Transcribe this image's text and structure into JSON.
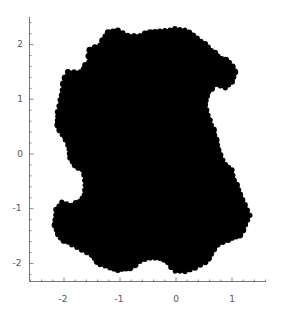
{
  "chart_data": {
    "type": "area",
    "title": "",
    "xlabel": "",
    "ylabel": "",
    "xlim": [
      -2.6,
      1.6
    ],
    "ylim": [
      -2.5,
      2.5
    ],
    "grid": false,
    "legend": null,
    "x_ticks": [
      -2,
      -1,
      0,
      1
    ],
    "x_tick_labels": [
      "-2",
      "-1",
      "0",
      "1"
    ],
    "y_ticks": [
      2,
      1,
      0,
      -1,
      -2
    ],
    "y_tick_labels": [
      "2",
      "1",
      "0",
      "-1",
      "-2"
    ],
    "fill_color": "#000000",
    "axis_color": "#666666",
    "approx_extent": {
      "x_min": -2.15,
      "x_max": 1.3,
      "y_min": -2.15,
      "y_max": 2.3
    },
    "outline_approx": [
      [
        -1.36,
        2.0
      ],
      [
        -1.21,
        2.22
      ],
      [
        -1.04,
        2.26
      ],
      [
        -0.86,
        2.17
      ],
      [
        -0.64,
        2.17
      ],
      [
        -0.46,
        2.22
      ],
      [
        -0.29,
        2.24
      ],
      [
        -0.02,
        2.29
      ],
      [
        0.16,
        2.27
      ],
      [
        0.3,
        2.16
      ],
      [
        0.52,
        2.01
      ],
      [
        0.75,
        1.79
      ],
      [
        0.96,
        1.68
      ],
      [
        1.05,
        1.5
      ],
      [
        1.0,
        1.32
      ],
      [
        0.88,
        1.21
      ],
      [
        0.7,
        1.26
      ],
      [
        0.57,
        1.14
      ],
      [
        0.52,
        0.9
      ],
      [
        0.61,
        0.62
      ],
      [
        0.7,
        0.35
      ],
      [
        0.75,
        0.07
      ],
      [
        0.88,
        -0.2
      ],
      [
        1.0,
        -0.29
      ],
      [
        1.05,
        -0.48
      ],
      [
        1.14,
        -0.75
      ],
      [
        1.23,
        -0.93
      ],
      [
        1.32,
        -1.12
      ],
      [
        1.25,
        -1.3
      ],
      [
        1.14,
        -1.48
      ],
      [
        0.93,
        -1.57
      ],
      [
        0.75,
        -1.66
      ],
      [
        0.64,
        -1.84
      ],
      [
        0.52,
        -1.97
      ],
      [
        0.34,
        -2.08
      ],
      [
        0.16,
        -2.15
      ],
      [
        -0.02,
        -2.15
      ],
      [
        -0.14,
        -1.97
      ],
      [
        -0.29,
        -1.9
      ],
      [
        -0.46,
        -1.9
      ],
      [
        -0.64,
        -1.97
      ],
      [
        -0.82,
        -2.08
      ],
      [
        -1.04,
        -2.12
      ],
      [
        -1.18,
        -2.08
      ],
      [
        -1.36,
        -2.03
      ],
      [
        -1.5,
        -1.84
      ],
      [
        -1.68,
        -1.75
      ],
      [
        -1.86,
        -1.66
      ],
      [
        -2.07,
        -1.54
      ],
      [
        -2.16,
        -1.3
      ],
      [
        -2.14,
        -1.02
      ],
      [
        -2.04,
        -0.88
      ],
      [
        -1.86,
        -0.93
      ],
      [
        -1.71,
        -0.88
      ],
      [
        -1.63,
        -0.75
      ],
      [
        -1.63,
        -0.48
      ],
      [
        -1.68,
        -0.29
      ],
      [
        -1.8,
        -0.2
      ],
      [
        -1.89,
        -0.07
      ],
      [
        -1.93,
        0.16
      ],
      [
        -2.04,
        0.35
      ],
      [
        -2.11,
        0.53
      ],
      [
        -2.11,
        0.77
      ],
      [
        -2.07,
        0.99
      ],
      [
        -2.04,
        1.17
      ],
      [
        -1.98,
        1.39
      ],
      [
        -1.93,
        1.5
      ],
      [
        -1.71,
        1.5
      ],
      [
        -1.57,
        1.68
      ],
      [
        -1.54,
        1.9
      ]
    ]
  }
}
